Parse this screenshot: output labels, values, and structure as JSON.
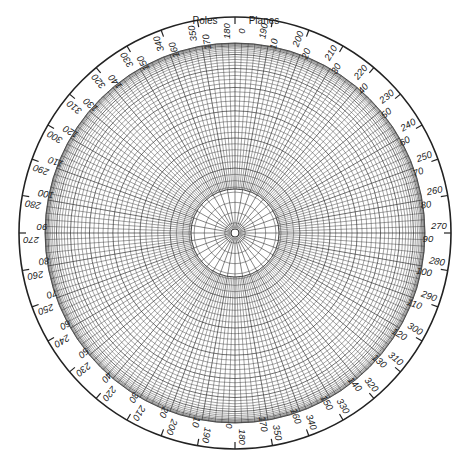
{
  "diagram": {
    "title_left": "Poles",
    "title_right": "Planes",
    "colors": {
      "line": "#222222",
      "grid": "#333333",
      "background": "#ffffff"
    },
    "geometry": {
      "cx": 235,
      "cy": 233,
      "outer_radius": 216,
      "grid_radius": 190,
      "inner_clear_radius": 44,
      "center_hole_radius": 4
    },
    "grid": {
      "ring_count": 45,
      "radial_step_deg": 2,
      "inner_radial_step_deg": 10,
      "inner_ring_count": 4
    },
    "scale_labels": [
      {
        "angle": 0,
        "pole": "180",
        "plane": "0"
      },
      {
        "angle": 10,
        "pole": "190",
        "plane": "10"
      },
      {
        "angle": 20,
        "pole": "200",
        "plane": "20"
      },
      {
        "angle": 30,
        "pole": "210",
        "plane": "30"
      },
      {
        "angle": 40,
        "pole": "220",
        "plane": "40"
      },
      {
        "angle": 50,
        "pole": "230",
        "plane": "50"
      },
      {
        "angle": 60,
        "pole": "240",
        "plane": "60"
      },
      {
        "angle": 70,
        "pole": "250",
        "plane": "70"
      },
      {
        "angle": 80,
        "pole": "260",
        "plane": "80"
      },
      {
        "angle": 90,
        "pole": "270",
        "plane": "90"
      },
      {
        "angle": 100,
        "pole": "280",
        "plane": "100"
      },
      {
        "angle": 110,
        "pole": "290",
        "plane": "110"
      },
      {
        "angle": 120,
        "pole": "300",
        "plane": "120"
      },
      {
        "angle": 130,
        "pole": "310",
        "plane": "130"
      },
      {
        "angle": 140,
        "pole": "320",
        "plane": "140"
      },
      {
        "angle": 150,
        "pole": "330",
        "plane": "150"
      },
      {
        "angle": 160,
        "pole": "340",
        "plane": "160"
      },
      {
        "angle": 170,
        "pole": "350",
        "plane": "170"
      },
      {
        "angle": 180,
        "pole": "180",
        "plane": "0"
      },
      {
        "angle": 190,
        "pole": "190",
        "plane": "10"
      },
      {
        "angle": 200,
        "pole": "200",
        "plane": "20"
      },
      {
        "angle": 210,
        "pole": "210",
        "plane": "30"
      },
      {
        "angle": 220,
        "pole": "220",
        "plane": "40"
      },
      {
        "angle": 230,
        "pole": "230",
        "plane": "50"
      },
      {
        "angle": 240,
        "pole": "240",
        "plane": "60"
      },
      {
        "angle": 250,
        "pole": "250",
        "plane": "70"
      },
      {
        "angle": 260,
        "pole": "260",
        "plane": "80"
      },
      {
        "angle": 270,
        "pole": "270",
        "plane": "90"
      },
      {
        "angle": 280,
        "pole": "280",
        "plane": "100"
      },
      {
        "angle": 290,
        "pole": "290",
        "plane": "110"
      },
      {
        "angle": 300,
        "pole": "300",
        "plane": "120"
      },
      {
        "angle": 310,
        "pole": "310",
        "plane": "130"
      },
      {
        "angle": 320,
        "pole": "320",
        "plane": "140"
      },
      {
        "angle": 330,
        "pole": "330",
        "plane": "150"
      },
      {
        "angle": 340,
        "pole": "340",
        "plane": "160"
      },
      {
        "angle": 350,
        "pole": "350",
        "plane": "170"
      }
    ]
  }
}
